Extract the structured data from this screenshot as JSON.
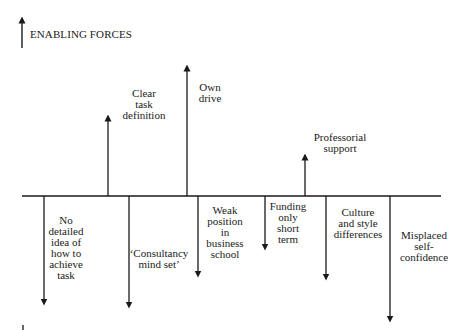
{
  "legend": {
    "enabling_label": "ENABLING FORCES",
    "restraining_label": ""
  },
  "colors": {
    "line": "#1a1a1a",
    "background": "#ffffff"
  },
  "enabling_forces": [
    {
      "id": "clear-task-definition",
      "lines": [
        "Clear",
        "task",
        "definition"
      ]
    },
    {
      "id": "own-drive",
      "lines": [
        "Own",
        "drive"
      ]
    },
    {
      "id": "professorial-support",
      "lines": [
        "Professorial",
        "support"
      ]
    }
  ],
  "restraining_forces": [
    {
      "id": "no-detailed-idea",
      "lines": [
        "No",
        "detailed",
        "idea of",
        "how to",
        "achieve",
        "task"
      ]
    },
    {
      "id": "consultancy-mind-set",
      "lines": [
        "‘Consultancy",
        "mind set’"
      ]
    },
    {
      "id": "weak-position",
      "lines": [
        "Weak",
        "position",
        "in",
        "business",
        "school"
      ]
    },
    {
      "id": "funding-short-term",
      "lines": [
        "Funding",
        "only",
        "short",
        "term"
      ]
    },
    {
      "id": "culture-style-differences",
      "lines": [
        "Culture",
        "and style",
        "differences"
      ]
    },
    {
      "id": "misplaced-self-confidence",
      "lines": [
        "Misplaced",
        "self-",
        "confidence"
      ]
    }
  ]
}
